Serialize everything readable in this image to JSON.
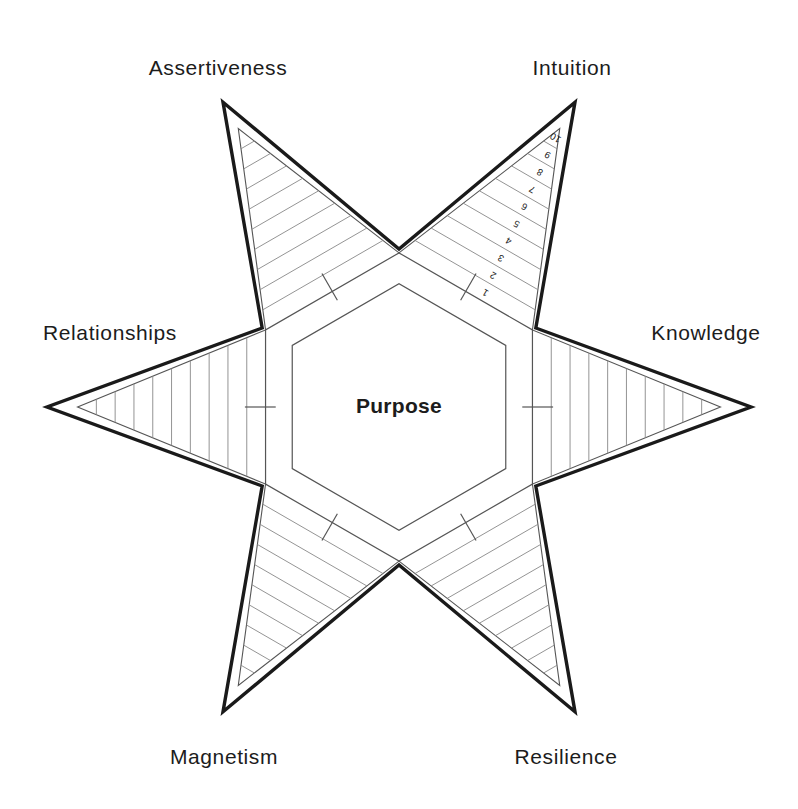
{
  "diagram": {
    "center_label": "Purpose",
    "type": "radar-star",
    "points": 6,
    "scale_min": 1,
    "scale_max": 10,
    "scale_ticks": [
      "1",
      "2",
      "3",
      "4",
      "5",
      "6",
      "7",
      "8",
      "9",
      "10"
    ],
    "scale_shown_on": "Intuition",
    "axes": [
      {
        "label": "Intuition",
        "angle_deg": -60,
        "position": {
          "x": 572,
          "y": 68
        }
      },
      {
        "label": "Knowledge",
        "angle_deg": 0,
        "position": {
          "x": 706,
          "y": 333
        }
      },
      {
        "label": "Resilience",
        "angle_deg": 60,
        "position": {
          "x": 566,
          "y": 757
        }
      },
      {
        "label": "Magnetism",
        "angle_deg": 120,
        "position": {
          "x": 224,
          "y": 757
        }
      },
      {
        "label": "Relationships",
        "angle_deg": 180,
        "position": {
          "x": 110,
          "y": 333
        }
      },
      {
        "label": "Assertiveness",
        "angle_deg": -120,
        "position": {
          "x": 218,
          "y": 68
        }
      }
    ],
    "colors": {
      "background": "#ffffff",
      "outline": "#1a1a1a",
      "inner_line": "#555555",
      "band_line": "#888888",
      "text": "#1c1c1c"
    }
  },
  "chart_data": {
    "type": "radar",
    "categories": [
      "Intuition",
      "Knowledge",
      "Resilience",
      "Magnetism",
      "Relationships",
      "Assertiveness"
    ],
    "scale": {
      "min": 1,
      "max": 10,
      "ticks": [
        1,
        2,
        3,
        4,
        5,
        6,
        7,
        8,
        9,
        10
      ]
    },
    "series": [
      {
        "name": "Outline",
        "values": [
          10,
          10,
          10,
          10,
          10,
          10
        ]
      }
    ],
    "center_label": "Purpose",
    "grid": true,
    "legend": "none"
  }
}
